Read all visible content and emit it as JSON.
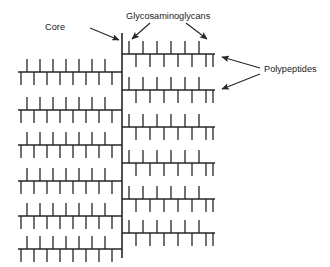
{
  "figure": {
    "background_color": "#ffffff",
    "line_color": "#262626",
    "text_color": "#1a1a1a"
  },
  "labels": {
    "core": "Core",
    "glycosaminoglycans": "Glycosaminoglycans",
    "polypeptides": "Polypeptides"
  },
  "structure": {
    "core": {
      "x": 122,
      "y_top": 33,
      "y_bottom": 258,
      "stroke_width": 1.6
    },
    "left_branches": {
      "x_start": 18,
      "x_end": 122,
      "row_y": [
        72,
        110,
        145,
        181,
        216,
        249
      ],
      "up_tick_length": 13,
      "down_tick_length": 13,
      "up_tick_x": [
        27,
        40,
        53,
        66,
        79,
        92,
        105
      ],
      "down_tick_x": [
        21,
        34,
        47,
        60,
        73,
        86,
        99,
        112
      ]
    },
    "right_branches": {
      "x_start": 122,
      "x_end": 215,
      "row_y": [
        54,
        90,
        127,
        163,
        199,
        233
      ],
      "up_tick_length": 13,
      "down_tick_length": 13,
      "up_tick_x": [
        129,
        143,
        157,
        171,
        185,
        199
      ],
      "down_tick_x": [
        136,
        150,
        164,
        178,
        192,
        206,
        213
      ]
    }
  },
  "annotations": {
    "core_label_pos": {
      "x": 65,
      "y": 30
    },
    "core_arrow": {
      "x1": 90,
      "y1": 28,
      "x2": 119,
      "y2": 40
    },
    "gag_label_pos": {
      "x": 126,
      "y": 19
    },
    "gag_arrow_left": {
      "x1": 150,
      "y1": 23,
      "x2": 132,
      "y2": 39
    },
    "gag_arrow_right": {
      "x1": 186,
      "y1": 23,
      "x2": 207,
      "y2": 39
    },
    "poly_label_pos": {
      "x": 264,
      "y": 72
    },
    "poly_arrow_upper": {
      "x1": 260,
      "y1": 68,
      "x2": 222,
      "y2": 57
    },
    "poly_arrow_lower": {
      "x1": 260,
      "y1": 74,
      "x2": 222,
      "y2": 89
    }
  }
}
